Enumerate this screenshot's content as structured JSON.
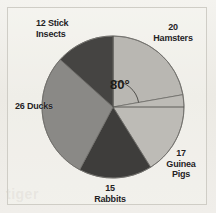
{
  "figure": {
    "background_color": "#efedE8",
    "frame_color": "#cfcdc6",
    "ghost_text": "mon rabbit",
    "ghost_text2": "tiger"
  },
  "annotation": {
    "angle_label": "80°",
    "angle_value": 80,
    "angle_unit": "degrees",
    "measured_segment": "Hamsters"
  },
  "chart_data": {
    "type": "pie",
    "title": "",
    "total": 90,
    "units": "animals",
    "start_angle_deg": -90,
    "direction": "clockwise",
    "legend": "labels-outside",
    "grid": false,
    "categories": [
      "Hamsters",
      "Guinea Pigs",
      "Rabbits",
      "Ducks",
      "Stick Insects"
    ],
    "values": [
      20,
      17,
      15,
      26,
      12
    ],
    "angles_deg": [
      80,
      68,
      60,
      104,
      48
    ],
    "colors": [
      "#b9b7b2",
      "#bdbbb6",
      "#3e3d3b",
      "#8a8986",
      "#454442"
    ],
    "labels": [
      {
        "name": "Hamsters",
        "value": 20,
        "text": "20\nHamsters"
      },
      {
        "name": "Guinea Pigs",
        "value": 17,
        "text": "17\nGuinea\nPigs"
      },
      {
        "name": "Rabbits",
        "value": 15,
        "text": "15\nRabbits"
      },
      {
        "name": "Ducks",
        "value": 26,
        "text": "26 Ducks"
      },
      {
        "name": "Stick Insects",
        "value": 12,
        "text": "12 Stick\nInsects"
      }
    ]
  }
}
